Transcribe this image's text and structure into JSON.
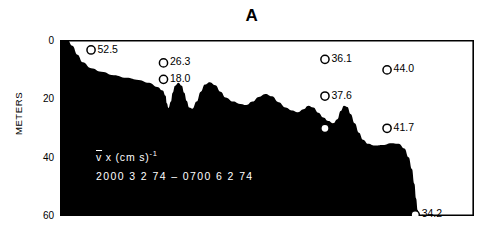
{
  "figure": {
    "panel_label": "A",
    "y_axis_title": "METERS",
    "y_ticks_major": [
      "0",
      "20",
      "40",
      "60"
    ],
    "annotation_line1_symbol": "v",
    "annotation_line1_rest": " x  (cm  s)",
    "annotation_line1_exponent": "-1",
    "annotation_line2": "2000   3 2  74 – 0700   6 2  74",
    "fill_color": "#000000",
    "background_color": "#ffffff",
    "marker_color": "#000000"
  },
  "chart_data": {
    "type": "area",
    "title": "A",
    "xlabel": "",
    "ylabel": "METERS",
    "ylim": [
      0,
      60
    ],
    "y_inverted": true,
    "grid": false,
    "legend": "none",
    "y_ticks_major": [
      0,
      20,
      40,
      60
    ],
    "y_ticks_minor": [
      10,
      30,
      50
    ],
    "units": "meters depth",
    "annotation": "v̄ x (cm s)-1   2000  3 2 74 - 0700  6 2 74",
    "markers": [
      {
        "label": "52.5",
        "value": 52.5,
        "x_frac": 0.075,
        "depth_m": 3.4
      },
      {
        "label": "26.3",
        "value": 26.3,
        "x_frac": 0.25,
        "depth_m": 7.8
      },
      {
        "label": "18.0",
        "value": 18.0,
        "x_frac": 0.25,
        "depth_m": 13.4
      },
      {
        "label": "36.1",
        "value": 36.1,
        "x_frac": 0.64,
        "depth_m": 6.6
      },
      {
        "label": "44.0",
        "value": 44.0,
        "x_frac": 0.79,
        "depth_m": 10.2
      },
      {
        "label": "37.6",
        "value": 37.6,
        "x_frac": 0.64,
        "depth_m": 19.1
      },
      {
        "label": "27.0",
        "value": 27.0,
        "x_frac": 0.64,
        "depth_m": 30.1
      },
      {
        "label": "41.7",
        "value": 41.7,
        "x_frac": 0.79,
        "depth_m": 30.1
      },
      {
        "label": "34.2",
        "value": 34.2,
        "x_frac": 0.858,
        "depth_m": 59.6
      }
    ],
    "profile_note": "Black silhouette of seabed / scattering layer; depth of upper boundary versus time",
    "profile_points": [
      [
        0.0,
        0.0
      ],
      [
        0.018,
        0.0
      ],
      [
        0.03,
        2.0
      ],
      [
        0.042,
        5.0
      ],
      [
        0.055,
        7.6
      ],
      [
        0.075,
        9.6
      ],
      [
        0.1,
        10.8
      ],
      [
        0.13,
        12.0
      ],
      [
        0.16,
        12.9
      ],
      [
        0.19,
        13.6
      ],
      [
        0.215,
        14.6
      ],
      [
        0.235,
        16.0
      ],
      [
        0.248,
        17.2
      ],
      [
        0.255,
        19.0
      ],
      [
        0.258,
        21.6
      ],
      [
        0.262,
        23.2
      ],
      [
        0.268,
        21.0
      ],
      [
        0.272,
        18.0
      ],
      [
        0.278,
        15.6
      ],
      [
        0.286,
        14.6
      ],
      [
        0.294,
        15.6
      ],
      [
        0.3,
        18.0
      ],
      [
        0.306,
        20.8
      ],
      [
        0.312,
        23.0
      ],
      [
        0.32,
        23.4
      ],
      [
        0.33,
        21.0
      ],
      [
        0.34,
        17.6
      ],
      [
        0.35,
        15.2
      ],
      [
        0.362,
        14.4
      ],
      [
        0.375,
        15.4
      ],
      [
        0.388,
        17.6
      ],
      [
        0.4,
        19.6
      ],
      [
        0.418,
        21.0
      ],
      [
        0.435,
        21.8
      ],
      [
        0.45,
        22.2
      ],
      [
        0.465,
        21.0
      ],
      [
        0.48,
        19.4
      ],
      [
        0.496,
        18.4
      ],
      [
        0.512,
        19.2
      ],
      [
        0.528,
        21.2
      ],
      [
        0.545,
        23.0
      ],
      [
        0.56,
        24.0
      ],
      [
        0.575,
        24.6
      ],
      [
        0.588,
        23.6
      ],
      [
        0.6,
        22.4
      ],
      [
        0.612,
        23.0
      ],
      [
        0.624,
        24.8
      ],
      [
        0.636,
        26.4
      ],
      [
        0.648,
        27.6
      ],
      [
        0.66,
        28.4
      ],
      [
        0.67,
        27.0
      ],
      [
        0.678,
        24.2
      ],
      [
        0.686,
        22.4
      ],
      [
        0.694,
        22.8
      ],
      [
        0.702,
        25.2
      ],
      [
        0.712,
        28.4
      ],
      [
        0.722,
        31.6
      ],
      [
        0.732,
        34.0
      ],
      [
        0.744,
        35.4
      ],
      [
        0.76,
        36.0
      ],
      [
        0.78,
        35.8
      ],
      [
        0.8,
        35.2
      ],
      [
        0.818,
        35.4
      ],
      [
        0.832,
        37.0
      ],
      [
        0.842,
        40.0
      ],
      [
        0.85,
        44.0
      ],
      [
        0.856,
        49.0
      ],
      [
        0.86,
        54.0
      ],
      [
        0.864,
        58.0
      ],
      [
        0.868,
        60.0
      ],
      [
        1.0,
        60.0
      ]
    ]
  }
}
